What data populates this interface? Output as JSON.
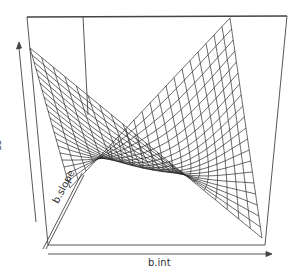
{
  "chart_data": {
    "type": "surface",
    "title": "",
    "xlabel": "b.int",
    "ylabel": "b.slope",
    "zlabel": "ss",
    "grid": false,
    "ticks": "none",
    "box": true,
    "axes_arrows": true,
    "mesh_lines_per_direction": 20,
    "surface_shape": "quadratic bowl elongated along a diagonal valley (correlated intercept/slope)",
    "line_color": "#333333",
    "background": "#ffffff"
  },
  "labels": {
    "x": "b.int",
    "y": "b.slope",
    "z": "ss"
  }
}
